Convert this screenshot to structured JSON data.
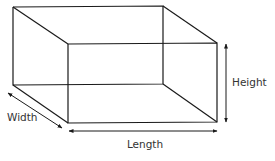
{
  "diagram": {
    "labels": {
      "width": "Width",
      "height": "Height",
      "length": "Length"
    },
    "colors": {
      "line": "#1a1a1a",
      "text": "#333333",
      "background": "#ffffff"
    }
  }
}
